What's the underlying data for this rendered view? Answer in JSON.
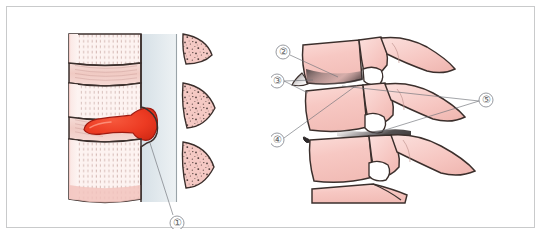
{
  "figure": {
    "border_color": "#c9cacb",
    "background": "#ffffff",
    "panels": [
      {
        "id": "left",
        "name": "sagittal-disc-herniation",
        "callouts": [
          {
            "id": "1",
            "label": "①",
            "x": 170,
            "y": 216,
            "target_x": 143,
            "target_y": 136
          }
        ]
      },
      {
        "id": "right",
        "name": "lateral-lumbar-spine-degeneration",
        "callouts": [
          {
            "id": "2",
            "label": "②",
            "x": 276,
            "y": 45,
            "target_x": 331,
            "target_y": 70
          },
          {
            "id": "3",
            "label": "③",
            "x": 270,
            "y": 74,
            "target_x": 301,
            "target_y": 86
          },
          {
            "id": "4",
            "label": "④",
            "x": 270,
            "y": 133,
            "target_x": 302,
            "target_y": 136
          },
          {
            "id": "5",
            "label": "⑤",
            "x": 479,
            "y": 93,
            "target_x": 362,
            "target_y": 128
          }
        ]
      }
    ],
    "colors": {
      "bone_fill": "#f7c8c3",
      "bone_fill_light": "#fbdcd8",
      "bone_outline": "#3b2f2c",
      "disc_normal": "#f3cfc9",
      "nucleus_red": "#ef3f28",
      "nucleus_outline": "#9e1a10",
      "canal_tint": "#dfe6ea",
      "trabecular_dot": "#4a3a37",
      "shading_dark": "#3f3a3b",
      "leader_line": "#6f7278",
      "callout_text": "#5d5f63"
    }
  }
}
